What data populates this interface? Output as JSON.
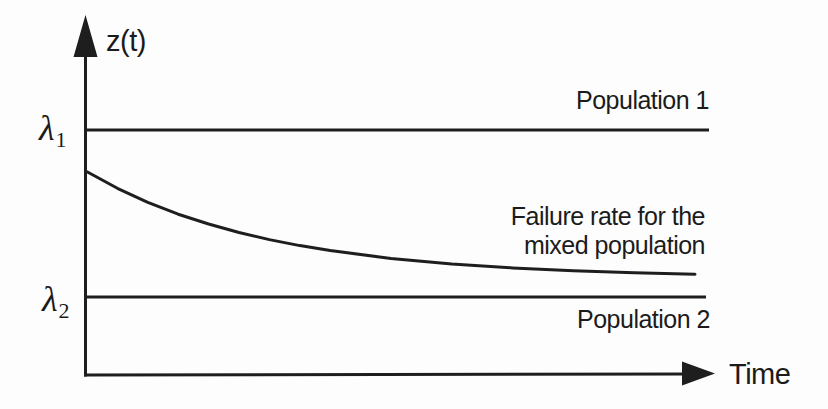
{
  "figure": {
    "y_axis_label": "z(t)",
    "x_axis_label": "Time",
    "lambda1": {
      "symbol": "λ",
      "subscript": "1"
    },
    "lambda2": {
      "symbol": "λ",
      "subscript": "2"
    },
    "population1_label": "Population 1",
    "population2_label": "Population 2",
    "mixed_annotation_line1": "Failure rate for the",
    "mixed_annotation_line2": "mixed population"
  },
  "colors": {
    "ink": "#1e1e1e",
    "background": "#fdfdfd"
  },
  "chart_data": {
    "type": "line",
    "xlabel": "Time",
    "ylabel": "z(t)",
    "grid": false,
    "legend": "inline-annotations",
    "x_range_normalized": [
      0,
      1
    ],
    "y_axis_tick_labels": [
      "λ1",
      "λ2"
    ],
    "note_units": "y values normalized: 0 = λ2 level, 1 = λ1 level; x normalized over shown time span",
    "series": [
      {
        "name": "Population 1",
        "style": "constant",
        "level_label": "λ1",
        "level_normalized": 1.0
      },
      {
        "name": "Failure rate for the mixed population",
        "style": "curve",
        "shape": "exponential decay from below λ1 toward λ2",
        "points": [
          [
            0.0,
            0.75
          ],
          [
            0.05,
            0.651
          ],
          [
            0.1,
            0.567
          ],
          [
            0.15,
            0.496
          ],
          [
            0.2,
            0.437
          ],
          [
            0.25,
            0.386
          ],
          [
            0.3,
            0.344
          ],
          [
            0.35,
            0.308
          ],
          [
            0.4,
            0.278
          ],
          [
            0.5,
            0.231
          ],
          [
            0.6,
            0.197
          ],
          [
            0.7,
            0.174
          ],
          [
            0.8,
            0.157
          ],
          [
            0.9,
            0.145
          ],
          [
            1.0,
            0.136
          ]
        ]
      },
      {
        "name": "Population 2",
        "style": "constant",
        "level_label": "λ2",
        "level_normalized": 0.0
      }
    ]
  }
}
